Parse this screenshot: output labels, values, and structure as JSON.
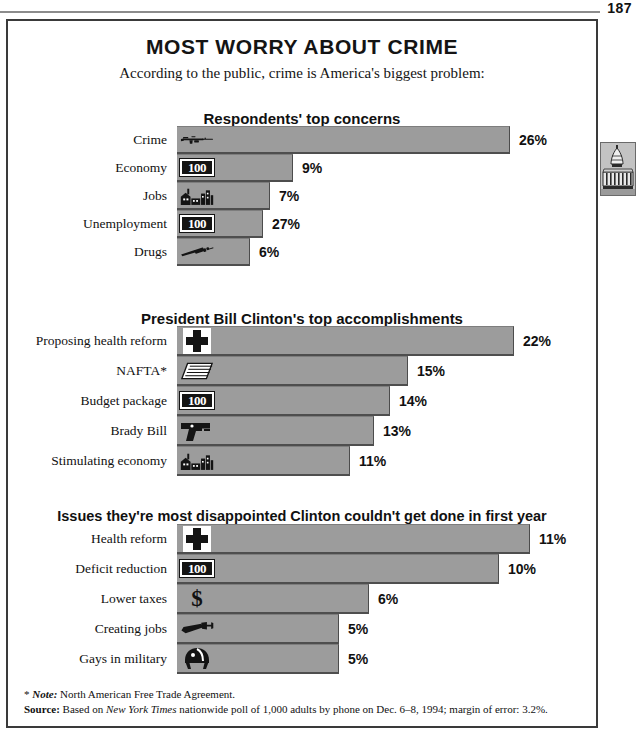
{
  "page": {
    "number": "187"
  },
  "header": {
    "title": "MOST WORRY ABOUT CRIME",
    "subtitle": "According to the public, crime is America's biggest problem:"
  },
  "side_tab": {
    "icon": "capitol-building-icon"
  },
  "chart_data": [
    {
      "type": "bar",
      "title": "Respondents' top concerns",
      "orientation": "horizontal",
      "xlabel": "",
      "ylabel": "",
      "grid": false,
      "legend": "none",
      "categories": [
        "Crime",
        "Economy",
        "Jobs",
        "Unemployment",
        "Drugs"
      ],
      "values": [
        26,
        9,
        7,
        27,
        6
      ],
      "value_labels": [
        "26%",
        "9%",
        "7%",
        "27%",
        "6%"
      ],
      "bar_pixel_widths": [
        333,
        116,
        93,
        86,
        73
      ],
      "icons": [
        "rifle-icon",
        "money-note-icon",
        "factory-icon",
        "money-note-icon",
        "syringe-icon"
      ]
    },
    {
      "type": "bar",
      "title": "President Bill Clinton's top accomplishments",
      "orientation": "horizontal",
      "xlabel": "",
      "ylabel": "",
      "grid": false,
      "legend": "none",
      "categories": [
        "Proposing health reform",
        "NAFTA*",
        "Budget package",
        "Brady Bill",
        "Stimulating economy"
      ],
      "values": [
        22,
        15,
        14,
        13,
        11
      ],
      "value_labels": [
        "22%",
        "15%",
        "14%",
        "13%",
        "11%"
      ],
      "bar_pixel_widths": [
        337,
        231,
        213,
        197,
        173
      ],
      "icons": [
        "medical-cross-icon",
        "paper-stack-icon",
        "money-note-icon",
        "handgun-icon",
        "factory-icon"
      ]
    },
    {
      "type": "bar",
      "title": "Issues they're most disappointed Clinton couldn't get done in first year",
      "orientation": "horizontal",
      "xlabel": "",
      "ylabel": "",
      "grid": false,
      "legend": "none",
      "categories": [
        "Health reform",
        "Deficit reduction",
        "Lower taxes",
        "Creating jobs",
        "Gays in military"
      ],
      "values": [
        11,
        10,
        6,
        5,
        5
      ],
      "value_labels": [
        "11%",
        "10%",
        "6%",
        "5%",
        "5%"
      ],
      "bar_pixel_widths": [
        353,
        322,
        192,
        162,
        162
      ],
      "icons": [
        "medical-cross-icon",
        "money-note-icon",
        "dollar-sign-icon",
        "wrench-icon",
        "military-helmet-icon"
      ]
    }
  ],
  "footnotes": {
    "note_marker": "*",
    "note_label": "Note:",
    "note_text": "North American Free Trade Agreement.",
    "source_label": "Source:",
    "source_prefix": "Based on",
    "source_italic": "New York Times",
    "source_suffix": "nationwide poll of 1,000 adults by phone on Dec. 6–8, 1994; margin of error: 3.2%."
  },
  "money_note_text": "100",
  "dollar_sign": "$",
  "colors": {
    "bar_fill": "#9c9c9c",
    "bar_shadow": "#4e4e4e",
    "frame": "#3a3a3a",
    "text": "#111111"
  }
}
